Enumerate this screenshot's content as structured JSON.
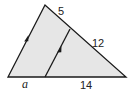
{
  "diagram": {
    "type": "triangle-proportionality",
    "colors": {
      "fill": "#e6e6e6",
      "stroke": "#1a1a1a",
      "text": "#222222"
    },
    "vertices": {
      "top": [
        45,
        5
      ],
      "bottom_left": [
        8,
        77
      ],
      "bottom_right": [
        126,
        77
      ]
    },
    "parallel_segment": {
      "from": [
        45,
        77
      ],
      "to": [
        70,
        29
      ]
    },
    "labels": {
      "top_right_upper": "5",
      "top_right_lower": "12",
      "base_left": "a",
      "base_right": "14"
    },
    "markers": [
      "parallel-arrow-left-side",
      "parallel-arrow-inner-segment"
    ]
  }
}
